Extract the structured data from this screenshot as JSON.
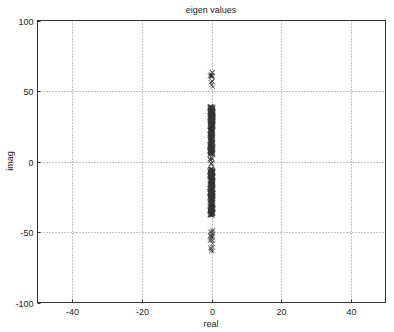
{
  "chart_data": {
    "type": "scatter",
    "title": "eigen values",
    "xlabel": "real",
    "ylabel": "imag",
    "xlim": [
      -50,
      50
    ],
    "ylim": [
      -100,
      100
    ],
    "xticks": [
      -40,
      -20,
      0,
      20,
      40
    ],
    "yticks": [
      -100,
      -50,
      0,
      50,
      100
    ],
    "xtick_labels": [
      "-40",
      "-20",
      "0",
      "20",
      "40"
    ],
    "ytick_labels": [
      "-100",
      "-50",
      "0",
      "50",
      "100"
    ],
    "grid": true,
    "marker": "x",
    "marker_color": "#333333",
    "series": [
      {
        "name": "eigenvalues",
        "description": "All eigenvalues lie on the imaginary axis (real = 0); dense clusters roughly from 5 to 39 and -5 to -38, sparse outliers near 0 and from ~53 to ~64 and ~-48 to ~-64",
        "real": 0,
        "imag_clusters": [
          {
            "from": 53,
            "to": 64,
            "density": "sparse"
          },
          {
            "from": 5,
            "to": 39,
            "density": "dense"
          },
          {
            "from": -3,
            "to": 3,
            "density": "sparse"
          },
          {
            "from": -38,
            "to": -5,
            "density": "dense"
          },
          {
            "from": -64,
            "to": -48,
            "density": "sparse"
          }
        ]
      }
    ]
  }
}
